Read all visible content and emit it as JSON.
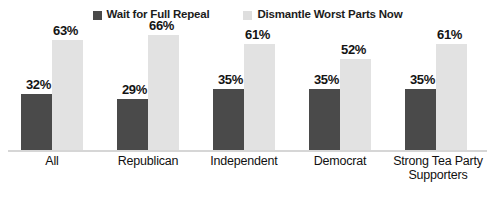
{
  "chart_data": {
    "type": "bar",
    "title": "",
    "subtitle": "",
    "xlabel": "",
    "ylabel": "",
    "ylim": [
      0,
      70
    ],
    "grid": false,
    "legend_position": "top-center",
    "value_suffix": "%",
    "categories": [
      "All",
      "Republican",
      "Independent",
      "Democrat",
      "Strong Tea Party Supporters"
    ],
    "category_lines": [
      [
        "All"
      ],
      [
        "Republican"
      ],
      [
        "Independent"
      ],
      [
        "Democrat"
      ],
      [
        "Strong Tea Party",
        "Supporters"
      ]
    ],
    "series": [
      {
        "name": "Wait for Full Repeal",
        "color": "#4a4a4a",
        "values": [
          32,
          29,
          35,
          35,
          35
        ],
        "labels": [
          "32%",
          "29%",
          "35%",
          "35%",
          "35%"
        ]
      },
      {
        "name": "Dismantle Worst Parts Now",
        "color": "#e2e2e2",
        "values": [
          63,
          66,
          61,
          52,
          61
        ],
        "labels": [
          "63%",
          "66%",
          "61%",
          "52%",
          "61%"
        ]
      }
    ]
  },
  "legend": {
    "items": [
      {
        "label": "Wait for Full Repeal",
        "swatch": "dark-square-icon",
        "color": "#4a4a4a"
      },
      {
        "label": "Dismantle Worst Parts Now",
        "swatch": "light-square-icon",
        "color": "#e2e2e2"
      }
    ]
  }
}
